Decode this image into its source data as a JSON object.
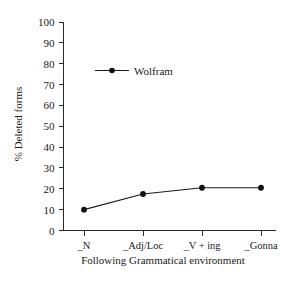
{
  "chart_data": {
    "type": "line",
    "title": "",
    "xlabel": "Following Grammatical environment",
    "ylabel": "% Deleted forms",
    "categories": [
      "_N",
      "_Adj/Loc",
      "_V + ing",
      "_Gonna"
    ],
    "series": [
      {
        "name": "Wolfram",
        "values": [
          10,
          17.5,
          20.5,
          20.5
        ],
        "color": "#1a1a1a",
        "marker": "circle"
      }
    ],
    "ylim": [
      0,
      100
    ],
    "ytick_labels": [
      "100",
      "90",
      "80",
      "70",
      "60",
      "50",
      "40",
      "30",
      "20",
      "10",
      "0"
    ],
    "ytick_values": [
      100,
      90,
      80,
      70,
      60,
      50,
      40,
      30,
      20,
      10,
      0
    ],
    "ytick_step": 10,
    "grid": false,
    "legend_position": "upper-left-inside",
    "legend_entries": [
      "Wolfram"
    ],
    "background_color": "#ffffff",
    "axis_color": "#2a2a2a"
  },
  "figure": {
    "ylabel": "% Deleted forms",
    "xlabel": "Following Grammatical environment",
    "legend_label": "Wolfram"
  }
}
